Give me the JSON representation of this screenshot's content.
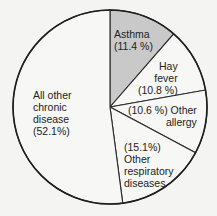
{
  "chart_data": {
    "type": "pie",
    "title": "",
    "start_angle_deg": 0,
    "direction": "clockwise",
    "slices": [
      {
        "label": "Asthma",
        "value": 11.4,
        "display": "(11.4 %)",
        "color": "#c9c9c9",
        "highlight": true
      },
      {
        "label": "Hay fever",
        "value": 10.8,
        "display": "(10.8 %)",
        "color": "#f7f7f5"
      },
      {
        "label": "Other allergy",
        "value": 10.6,
        "display": "(10.6 %)",
        "color": "#f7f7f5"
      },
      {
        "label": "Other respiratory diseases",
        "value": 15.1,
        "display": "(15.1%)",
        "color": "#f7f7f5"
      },
      {
        "label": "All other chronic disease",
        "value": 52.1,
        "display": "(52.1%)",
        "color": "#f7f7f5"
      }
    ],
    "legend": "none (labels inside slices)"
  },
  "labels": {
    "asthma": {
      "line1": "Asthma",
      "line2": "(11.4 %)"
    },
    "hay_fever": {
      "line1": "Hay",
      "line2": "fever",
      "line3": "(10.8 %)"
    },
    "other_allergy": {
      "line1": "(10.6 %)  Other",
      "line2": "allergy"
    },
    "other_resp": {
      "line1": "(15.1%)",
      "line2": "Other",
      "line3": "respiratory",
      "line4": "diseases"
    },
    "other_chronic": {
      "line1": "All other",
      "line2": "chronic",
      "line3": "disease",
      "line4": "(52.1%)"
    }
  }
}
